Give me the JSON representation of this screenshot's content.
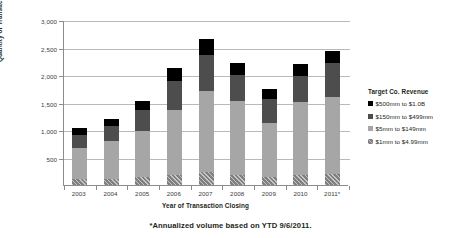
{
  "chart_data": {
    "type": "bar",
    "stacked": true,
    "title": "",
    "xlabel": "Year of Transaction Closing",
    "ylabel": "Quantity of Transactions",
    "ylim": [
      0,
      3000
    ],
    "ytick_values": [
      0,
      500,
      1000,
      1500,
      2000,
      2500,
      3000
    ],
    "ytick_labels": [
      "",
      "500",
      "1,000",
      "1,500",
      "2,000",
      "2,500",
      "3,000"
    ],
    "grid": true,
    "legend_position": "right",
    "legend_title": "Target Co. Revenue",
    "categories": [
      "2003",
      "2004",
      "2005",
      "2006",
      "2007",
      "2008",
      "2009",
      "2010",
      "2011*"
    ],
    "series": [
      {
        "name": "$500mm to $1.0B",
        "color": "#000000",
        "values": [
          130,
          140,
          160,
          230,
          300,
          215,
          185,
          215,
          230
        ]
      },
      {
        "name": "$150mm to $499mm",
        "color": "#4d4d4d",
        "values": [
          230,
          260,
          390,
          525,
          645,
          470,
          420,
          480,
          610
        ]
      },
      {
        "name": "$5mm to $149mm",
        "color": "#a6a6a6",
        "values": [
          570,
          690,
          840,
          1175,
          1475,
          1350,
          985,
          1330,
          1405
        ]
      },
      {
        "name": "$1mm to $4.99mm",
        "color": "#7f7f7f",
        "values": [
          110,
          115,
          140,
          190,
          235,
          180,
          150,
          180,
          195
        ]
      }
    ],
    "totals": [
      1040,
      1205,
      1530,
      2120,
      2655,
      2215,
      1740,
      2205,
      2440
    ],
    "footnote": "*Annualized volume based on YTD 9/6/2011."
  },
  "legend": {
    "title": "Target Co. Revenue",
    "items": [
      {
        "label": "$500mm to $1.0B"
      },
      {
        "label": "$150mm to $499mm"
      },
      {
        "label": "$5mm to $149mm"
      },
      {
        "label": "$1mm to $4.99mm"
      }
    ]
  },
  "axes": {
    "y_title": "Quantity of Transactions",
    "x_title": "Year of Transaction Closing"
  },
  "footnote": "*Annualized volume based on YTD 9/6/2011."
}
